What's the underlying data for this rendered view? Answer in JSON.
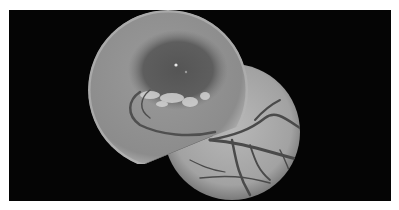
{
  "image": {
    "description": "Grayscale retinal fundus photograph montage: two overlapping circular fundus fields on black background",
    "background_color": "#050505",
    "page_color": "#ffffff",
    "fields": [
      {
        "name": "upper-left field (macula)",
        "center": [
          168,
          90
        ],
        "radius": 80,
        "tone": "#8a8a8a",
        "features": [
          "dark macular region",
          "bright foveal reflex",
          "pale exudate patches below macula",
          "curved vessel arc"
        ]
      },
      {
        "name": "lower-right field (vessels)",
        "center": [
          232,
          132
        ],
        "radius": 68,
        "tone": "#a6a6a6",
        "features": [
          "branching retinal vessels",
          "smooth bright background"
        ]
      }
    ]
  }
}
